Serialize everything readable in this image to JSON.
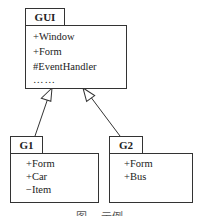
{
  "diagram": {
    "type": "uml-package-generalization",
    "packages": [
      {
        "name": "GUI",
        "members": [
          "+Window",
          "+Form",
          "#EventHandler",
          "……"
        ]
      },
      {
        "name": "G1",
        "members": [
          "+Form",
          "+Car",
          "−Item"
        ]
      },
      {
        "name": "G2",
        "members": [
          "+Form",
          "+Bus"
        ]
      }
    ],
    "relations": [
      {
        "from": "G1",
        "to": "GUI",
        "kind": "generalization"
      },
      {
        "from": "G2",
        "to": "GUI",
        "kind": "generalization"
      }
    ],
    "caption": "图 ... 示例"
  }
}
